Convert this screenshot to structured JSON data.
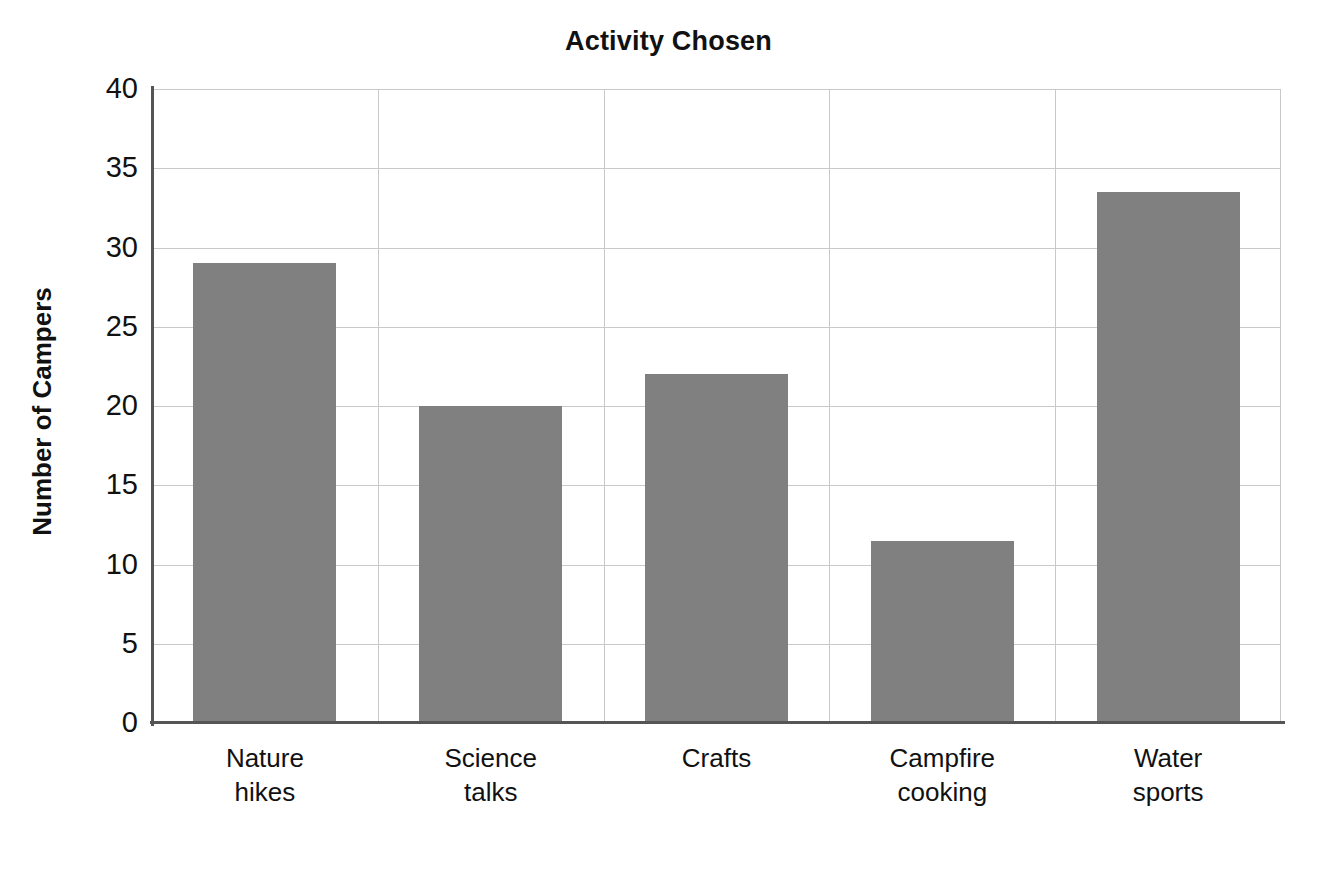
{
  "chart_data": {
    "type": "bar",
    "title": "Activity Chosen",
    "xlabel": "",
    "ylabel": "Number of Campers",
    "categories": [
      "Nature hikes",
      "Science talks",
      "Crafts",
      "Campfire cooking",
      "Water sports"
    ],
    "values": [
      29,
      20,
      22,
      11.5,
      33.5
    ],
    "ylim": [
      0,
      40
    ],
    "ytick_values": [
      0,
      5,
      10,
      15,
      20,
      25,
      30,
      35,
      40
    ],
    "ytick_labels": [
      "0",
      "5",
      "10",
      "15",
      "20",
      "25",
      "30",
      "35",
      "40"
    ],
    "grid": true,
    "legend": false,
    "legend_position": "none",
    "bar_color": "#808080",
    "grid_color": "#c9c9c9",
    "axis_color": "#555555",
    "background_color": "#ffffff"
  },
  "labels": {
    "category_lines": [
      [
        "Nature",
        "hikes"
      ],
      [
        "Science",
        "talks"
      ],
      [
        "Crafts",
        ""
      ],
      [
        "Campfire",
        "cooking"
      ],
      [
        "Water",
        "sports"
      ]
    ]
  }
}
